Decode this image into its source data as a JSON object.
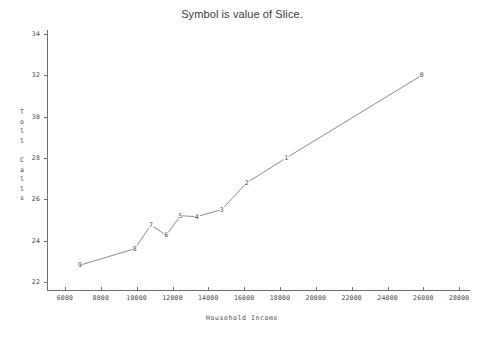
{
  "chart_data": {
    "type": "line",
    "title": "Symbol is value of Slice.",
    "xlabel": "Household Income",
    "ylabel": "Toll Calls",
    "ylabel_chars": [
      "T",
      "o",
      "l",
      "l",
      " ",
      "C",
      "a",
      "l",
      "l",
      "s"
    ],
    "xlim": [
      5000,
      28600
    ],
    "ylim": [
      21.6,
      34.2
    ],
    "xticks": [
      6000,
      8000,
      10000,
      12000,
      14000,
      16000,
      18000,
      20000,
      22000,
      24000,
      26000,
      28000
    ],
    "yticks": [
      22,
      24,
      26,
      28,
      30,
      32,
      34
    ],
    "grid": false,
    "legend": false,
    "marker_style": "slice-digit-symbol",
    "line_color": "#6f6f6f",
    "text_color": "#4a4a4a",
    "background": "#ffffff",
    "point_labels": [
      "9",
      "8",
      "7",
      "6",
      "5",
      "4",
      "3",
      "2",
      "1",
      "0"
    ],
    "x": [
      6840,
      9900,
      10800,
      11650,
      12450,
      13350,
      14750,
      16150,
      18350,
      25900
    ],
    "y": [
      22.8,
      23.6,
      24.75,
      24.25,
      25.2,
      25.15,
      25.5,
      26.8,
      28.0,
      32.0
    ],
    "points": [
      {
        "label": "9",
        "x": 6840,
        "y": 22.8
      },
      {
        "label": "8",
        "x": 9900,
        "y": 23.6
      },
      {
        "label": "7",
        "x": 10800,
        "y": 24.75
      },
      {
        "label": "6",
        "x": 11650,
        "y": 24.25
      },
      {
        "label": "5",
        "x": 12450,
        "y": 25.2
      },
      {
        "label": "4",
        "x": 13350,
        "y": 25.15
      },
      {
        "label": "3",
        "x": 14750,
        "y": 25.5
      },
      {
        "label": "2",
        "x": 16150,
        "y": 26.8
      },
      {
        "label": "1",
        "x": 18350,
        "y": 28.0
      },
      {
        "label": "0",
        "x": 25900,
        "y": 32.0
      }
    ]
  }
}
